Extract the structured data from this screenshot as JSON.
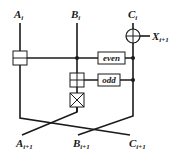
{
  "diagram": {
    "inputs": [
      {
        "base": "A",
        "sub": "i"
      },
      {
        "base": "B",
        "sub": "i"
      },
      {
        "base": "C",
        "sub": "i"
      }
    ],
    "outputs": [
      {
        "base": "A",
        "sub": "i+1"
      },
      {
        "base": "B",
        "sub": "i+1"
      },
      {
        "base": "C",
        "sub": "i+1"
      }
    ],
    "xor_output": {
      "base": "X",
      "sub": "i+1"
    },
    "boxes": {
      "even": "even",
      "odd": "odd"
    },
    "colors": {
      "line": "#1a1a1a",
      "background": "#ffffff"
    }
  }
}
